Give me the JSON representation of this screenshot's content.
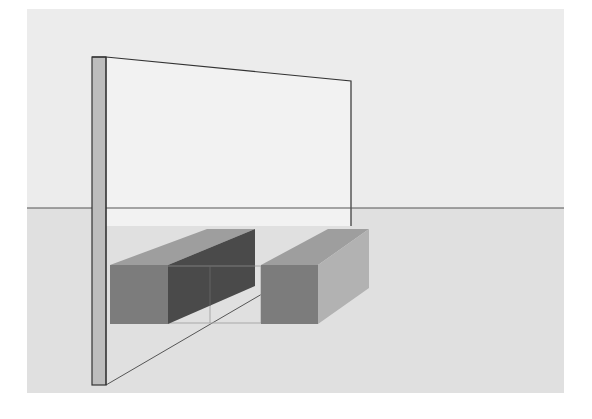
{
  "diagram": {
    "colors": {
      "page_background": "#ffffff",
      "sky": "#ececec",
      "ground": "#e0e0e0",
      "horizon_line": "#555555",
      "panel_face": "#f2f2f2",
      "panel_edge_strip": "#bdbdbd",
      "panel_outline": "#333333",
      "box_front": "#7c7c7c",
      "box_top": "#9e9e9e",
      "box_side_dark": "#4a4a4a",
      "box_side_light": "#b2b2b2",
      "guide_lines": "#a8a8a8",
      "ground_diagonal": "#555555"
    },
    "elements": {
      "horizon": "horizon line",
      "panel": "vertical panel",
      "left_box": "left box",
      "right_box": "right box",
      "guide_rectangle": "outline rectangle between boxes",
      "ground_line": "diagonal ground line"
    }
  }
}
